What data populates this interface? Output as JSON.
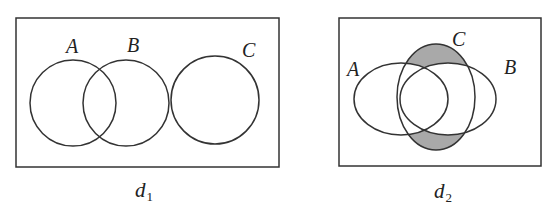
{
  "diagrams": [
    {
      "caption": "d",
      "caption_sub": "1",
      "sets": [
        {
          "label": "A"
        },
        {
          "label": "B"
        },
        {
          "label": "C"
        }
      ],
      "description": "A and B overlap; C is disjoint (tangent to B)"
    },
    {
      "caption": "d",
      "caption_sub": "2",
      "sets": [
        {
          "label": "A"
        },
        {
          "label": "B"
        },
        {
          "label": "C"
        }
      ],
      "shaded_region": "C minus (A union B)",
      "shade_color": "#a9a9a9"
    }
  ]
}
